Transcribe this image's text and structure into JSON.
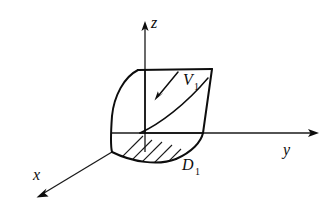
{
  "figure": {
    "kind": "3d-coordinate-diagram",
    "background_color": "#ffffff",
    "line_color": "#0d0d0d"
  },
  "axes": [
    {
      "id": "x",
      "label": "x",
      "label_x": 33,
      "label_y": 180,
      "direction": "down-left toward viewer",
      "tip_x": 37,
      "tip_y": 198
    },
    {
      "id": "y",
      "label": "y",
      "label_x": 283,
      "label_y": 155,
      "direction": "right",
      "tip_x": 318,
      "tip_y": 133
    },
    {
      "id": "z",
      "label": "z",
      "label_x": 151,
      "label_y": 28,
      "direction": "up",
      "tip_x": 145,
      "tip_y": 22
    }
  ],
  "origin": {
    "x": 112,
    "y": 152
  },
  "labels": {
    "volume": {
      "symbol": "V",
      "subscript": "1",
      "full": "V1",
      "x": 176,
      "y": 86
    },
    "region": {
      "symbol": "D",
      "subscript": "1",
      "full": "D1",
      "x": 182,
      "y": 170
    }
  },
  "annotations": [
    {
      "name": "volume-pointer-arrow",
      "from_x": 178,
      "from_y": 72,
      "to_x": 155,
      "to_y": 100
    }
  ],
  "shaded_region": {
    "name": "D1",
    "style": "diagonal-hatch",
    "hatch_count": 9,
    "hatch_angle_deg": 45
  }
}
